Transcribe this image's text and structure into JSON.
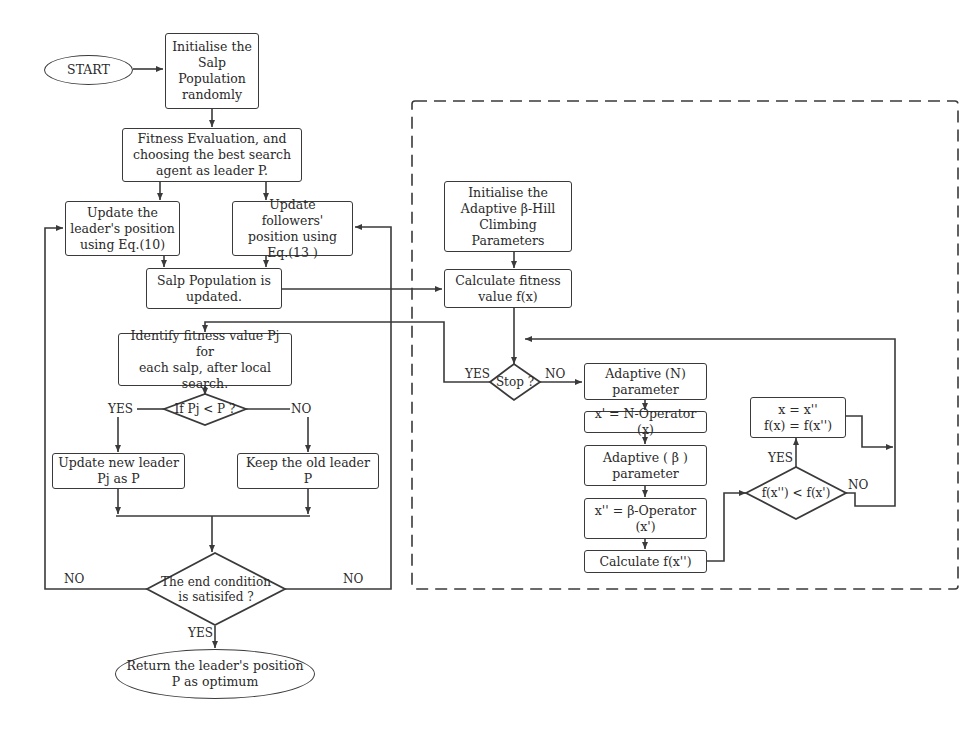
{
  "diagram": {
    "type": "flowchart",
    "left_flow": {
      "start": "START",
      "init": "Initialise the\nSalp\nPopulation\nrandomly",
      "fitness_eval": "Fitness Evaluation, and\nchoosing the best search\nagent as leader P.",
      "update_leader": "Update the\nleader's position\nusing Eq.(10)",
      "update_followers": "Update followers'\nposition using\nEq.(13 )",
      "population_updated": "Salp Population  is\nupdated.",
      "identify_fitness": "Identify fitness value Pj for\neach salp, after local\nsearch.",
      "decision_pj": "If Pj < P ?",
      "yes_label": "YES",
      "no_label": "NO",
      "update_new_leader": "Update new leader\nPj as P",
      "keep_old_leader": "Keep the old leader P",
      "end_condition": "The end condition\nis satisifed ?",
      "end_no_left": "NO",
      "end_no_right": "NO",
      "end_yes": "YES",
      "return": "Return the leader's  position\nP as optimum"
    },
    "right_flow": {
      "init_params": "Initialise the\nAdaptive β-Hill\nClimbing\nParameters",
      "calc_fitness": "Calculate fitness\nvalue  f(x)",
      "stop_decision": "Stop ?",
      "stop_yes": "YES",
      "stop_no": "NO",
      "adaptive_n": "Adaptive (N)\nparameter",
      "n_operator": "x' = N-Operator (x)",
      "adaptive_beta": "Adaptive ( β )\nparameter",
      "beta_operator": "x'' = β-Operator\n(x')",
      "calc_fxpp": "Calculate f(x'')",
      "compare_decision": "f(x'') < f(x')",
      "compare_yes": "YES",
      "compare_no": "NO",
      "assign": "x = x''\nf(x) = f(x'')"
    }
  }
}
